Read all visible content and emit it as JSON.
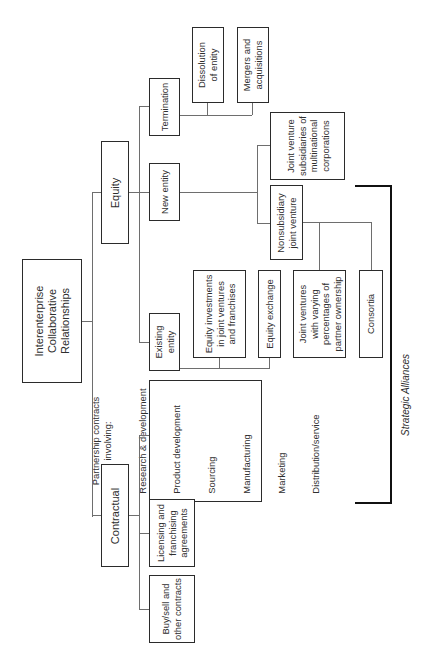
{
  "diagram": {
    "root": "Interenterprise\nCollaborative\nRelationships",
    "branches": {
      "equity": {
        "label": "Equity",
        "children": {
          "termination": {
            "label": "Termination",
            "children": [
              "Dissolution\nof entity",
              "Mergers and\nacquisitions"
            ]
          },
          "new_entity": {
            "label": "New entity",
            "children": {
              "jv_subsidiaries": "Joint venture\nsubsidiaries of\nmultinational\ncorporations",
              "nonsubsidiary_jv": {
                "label": "Nonsubsidiary\njoint venture",
                "children": [
                  "Joint ventures\nwith varying\npercentages of\npartner ownership",
                  "Consortia"
                ]
              }
            }
          },
          "existing_entity": {
            "label": "Existing\nentity",
            "children": [
              "Equity investments\nin joint ventures\nand franchises",
              "Equity exchange"
            ]
          }
        }
      },
      "contractual": {
        "label": "Contractual",
        "children": [
          "Partnership contracts\ninvolving:",
          "Licensing and\nfranchising\nagreements",
          "Buy/sell and\nother contracts"
        ],
        "partnership_items": [
          "Research & development",
          "Product development",
          "Sourcing",
          "Manufacturing",
          "Marketing",
          "Distribution/service"
        ]
      }
    },
    "bracket_label": "Strategic Alliances"
  }
}
